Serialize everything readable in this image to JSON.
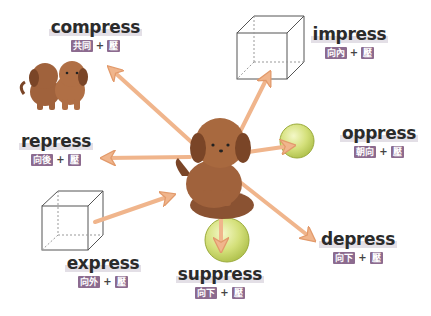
{
  "colors": {
    "arrow": "#f0b58c",
    "arrow_stroke": "#e29a6b",
    "tag_bg": "#8c6b8f",
    "tag_text": "#ffffff",
    "dog": "#a0623c",
    "dog_dark": "#7a4527",
    "sphere": "#d4e07a",
    "sphere_stroke": "#9bab3c",
    "cube_stroke": "#555555",
    "word_text": "#2b2b2b"
  },
  "words": [
    {
      "id": "compress",
      "word": "compress",
      "prefix": "共同",
      "root": "壓",
      "object": "two-dogs"
    },
    {
      "id": "impress",
      "word": "impress",
      "prefix": "向內",
      "root": "壓",
      "object": "cube"
    },
    {
      "id": "oppress",
      "word": "oppress",
      "prefix": "朝向",
      "root": "壓",
      "object": "sphere"
    },
    {
      "id": "repress",
      "word": "repress",
      "prefix": "向後",
      "root": "壓",
      "object": "none"
    },
    {
      "id": "express",
      "word": "express",
      "prefix": "向外",
      "root": "壓",
      "object": "cube"
    },
    {
      "id": "suppress",
      "word": "suppress",
      "prefix": "向下",
      "root": "壓",
      "object": "sphere"
    },
    {
      "id": "depress",
      "word": "depress",
      "prefix": "向下",
      "root": "壓",
      "object": "none"
    }
  ],
  "plus": "+",
  "center": {
    "icon": "dog-sitting-on-cushion-icon"
  }
}
